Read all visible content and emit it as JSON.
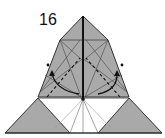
{
  "diagram": {
    "step_number": "16",
    "colors": {
      "paper_gray": "#a9a9a9",
      "paper_white": "#ffffff",
      "line": "#333333",
      "light_line": "#777777"
    },
    "symbols": [
      "valley-fold-lines",
      "fold-arrows",
      "reference-dots"
    ]
  }
}
